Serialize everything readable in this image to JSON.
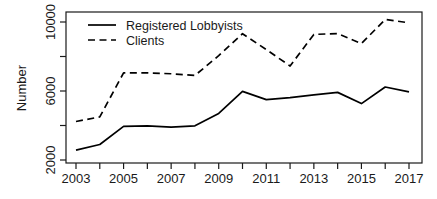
{
  "chart_data": {
    "type": "line",
    "title": "",
    "xlabel": "",
    "ylabel": "Number",
    "x": [
      2003,
      2004,
      2005,
      2006,
      2007,
      2008,
      2009,
      2010,
      2011,
      2012,
      2013,
      2014,
      2015,
      2016,
      2017
    ],
    "xlim": [
      2003,
      2017
    ],
    "ylim": [
      2000,
      10500
    ],
    "grid": false,
    "legend_position": "top-left",
    "x_tick_labels": [
      "2003",
      "2005",
      "2007",
      "2009",
      "2011",
      "2013",
      "2015",
      "2017"
    ],
    "x_tick_values": [
      2003,
      2005,
      2007,
      2009,
      2011,
      2013,
      2015,
      2017
    ],
    "x_minor_tick_values": [
      2004,
      2006,
      2008,
      2010,
      2012,
      2014,
      2016
    ],
    "y_tick_labels": [
      "2000",
      "6000",
      "10000"
    ],
    "y_tick_values": [
      2000,
      6000,
      10000
    ],
    "y_minor_tick_values": [
      4000,
      8000
    ],
    "series": [
      {
        "name": "Registered Lobbyists",
        "style": "solid",
        "color": "#000000",
        "values": [
          2570,
          2900,
          3950,
          3980,
          3900,
          3980,
          4700,
          5980,
          5500,
          5620,
          5780,
          5920,
          5270,
          6230,
          5950
        ]
      },
      {
        "name": "Clients",
        "style": "dashed",
        "color": "#000000",
        "values": [
          4230,
          4500,
          7050,
          7050,
          7000,
          6900,
          8050,
          9320,
          8400,
          7450,
          9280,
          9330,
          8750,
          10150,
          9950
        ]
      }
    ]
  },
  "legend": {
    "items": [
      {
        "label": "Registered Lobbyists",
        "style": "solid"
      },
      {
        "label": "Clients",
        "style": "dashed"
      }
    ]
  }
}
